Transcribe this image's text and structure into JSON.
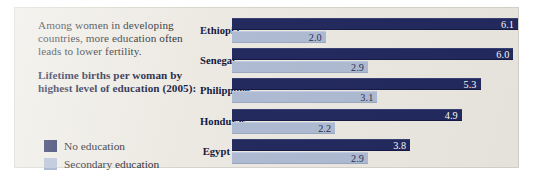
{
  "panel": {
    "intro_text": "Among women in developing countries, more education often leads to lower fertility.",
    "subhead_text": "Lifetime births per woman by highest level of education (2005):"
  },
  "legend": {
    "items": [
      {
        "label": "No education",
        "color": "#232a5e",
        "swatch_name": "legend-swatch-no-education"
      },
      {
        "label": "Secondary education",
        "color": "#aebbd2",
        "swatch_name": "legend-swatch-secondary-education"
      }
    ]
  },
  "chart_data": {
    "type": "bar",
    "orientation": "horizontal",
    "title": "Lifetime births per woman by highest level of education (2005):",
    "subtitle": "Among women in developing countries, more education often leads to lower fertility.",
    "xlabel": "",
    "ylabel": "",
    "grid": false,
    "legend_position": "left",
    "xlim": [
      0,
      6.1
    ],
    "categories": [
      "Ethiopia",
      "Senegal",
      "Philippines",
      "Honduras",
      "Egypt"
    ],
    "series": [
      {
        "name": "No education",
        "color": "#232a5e",
        "values": [
          6.1,
          6.0,
          5.3,
          4.9,
          3.8
        ],
        "labels": [
          "6.1",
          "6.0",
          "5.3",
          "4.9",
          "3.8"
        ]
      },
      {
        "name": "Secondary education",
        "color": "#aebbd2",
        "values": [
          2.0,
          2.9,
          3.1,
          2.2,
          2.9
        ],
        "labels": [
          "2.0",
          "2.9",
          "3.1",
          "2.2",
          "2.9"
        ]
      }
    ],
    "pixels_per_unit": 46.9
  }
}
